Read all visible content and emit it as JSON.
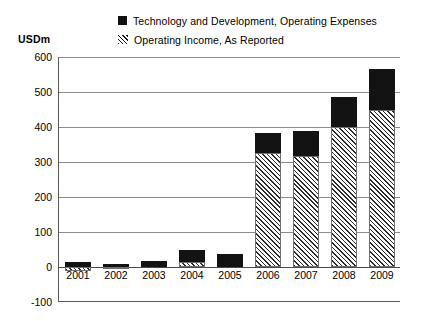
{
  "axis_unit": "USDm",
  "legend": {
    "items": [
      {
        "label": "Technology and Development, Operating Expenses",
        "swatch": "solid-square-icon",
        "color": "#131313"
      },
      {
        "label": "Operating Income, As Reported",
        "swatch": "hatched-square-icon",
        "color": "#2b2b2b"
      }
    ]
  },
  "chart_data": {
    "type": "bar",
    "stacked": true,
    "title": "",
    "subtitle": "",
    "xlabel": "",
    "ylabel": "USDm",
    "ylim": [
      -100,
      600
    ],
    "yticks": [
      600,
      500,
      400,
      300,
      200,
      100,
      0,
      -100
    ],
    "ytick_labels": [
      "600",
      "500",
      "400",
      "300",
      "200",
      "100",
      "0",
      "-100"
    ],
    "grid": true,
    "legend_position": "top",
    "categories": [
      "2001",
      "2002",
      "2003",
      "2004",
      "2005",
      "2006",
      "2007",
      "2008",
      "2009"
    ],
    "series": [
      {
        "name": "Technology and Development, Operating Expenses",
        "pattern": "solid",
        "color": "#131313",
        "values": [
          15,
          10,
          18,
          35,
          37,
          57,
          72,
          85,
          115
        ]
      },
      {
        "name": "Operating Income, As Reported",
        "pattern": "hatched",
        "color": "#2b2b2b",
        "values": [
          -12,
          -5,
          0,
          15,
          0,
          326,
          318,
          400,
          450
        ]
      }
    ],
    "bar_totals": [
      15,
      10,
      18,
      50,
      37,
      383,
      390,
      485,
      565
    ]
  }
}
